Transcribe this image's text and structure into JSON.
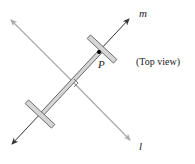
{
  "diagram": {
    "caption": "(Top view)",
    "labels": {
      "line_m": "m",
      "line_l": "l",
      "point_p": "P"
    },
    "colors": {
      "line_m": "#333333",
      "line_l": "#aaaaaa",
      "bar_fill": "#d6d6d6",
      "bar_stroke": "#555555",
      "point": "#000000"
    }
  }
}
